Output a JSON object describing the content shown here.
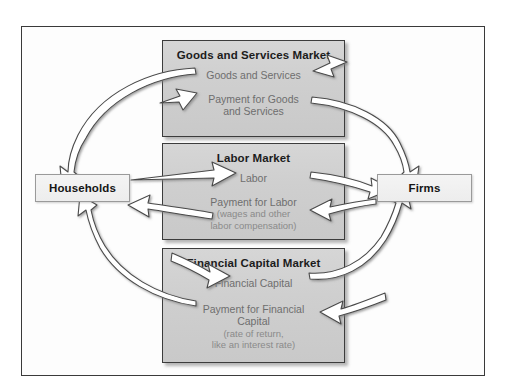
{
  "diagram": {
    "type": "circular-flow",
    "actors": {
      "left": {
        "name": "households",
        "label": "Households"
      },
      "right": {
        "name": "firms",
        "label": "Firms"
      }
    },
    "markets": [
      {
        "id": "goods",
        "title": "Goods and Services Market",
        "flow_real": "Goods and Services",
        "flow_payment_line1": "Payment for Goods",
        "flow_payment_line2": "and Services",
        "sub_line1": "",
        "sub_line2": ""
      },
      {
        "id": "labor",
        "title": "Labor Market",
        "flow_real": "Labor",
        "flow_payment_line1": "Payment for Labor",
        "flow_payment_line2": "",
        "sub_line1": "(wages and other",
        "sub_line2": "labor compensation)"
      },
      {
        "id": "finance",
        "title": "Financial Capital Market",
        "flow_real": "Financial Capital",
        "flow_payment_line1": "Payment for Financial",
        "flow_payment_line2": "Capital",
        "sub_line1": "(rate of return,",
        "sub_line2": "like an interest rate)"
      }
    ],
    "colors": {
      "frame_border": "#3a3a3a",
      "market_fill": "#cfcfcf",
      "market_border": "#3c3c3c",
      "actor_fill": "#f1f1f1",
      "actor_border": "#9a9a9a",
      "title_text": "#1c1c1c",
      "flow_text": "#6e6e6e",
      "sub_text": "#8a8a8a",
      "arrow_fill": "#ffffff",
      "arrow_stroke": "#4a4a4a",
      "page_background": "#ffffff"
    }
  }
}
